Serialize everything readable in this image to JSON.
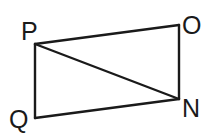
{
  "diagram": {
    "type": "quadrilateral-with-diagonal",
    "stroke_color": "#1a1a1a",
    "vertices": {
      "P": {
        "label": "P",
        "x": 35,
        "y": 44
      },
      "O": {
        "label": "O",
        "x": 179,
        "y": 25
      },
      "N": {
        "label": "N",
        "x": 179,
        "y": 99
      },
      "Q": {
        "label": "Q",
        "x": 35,
        "y": 118
      }
    },
    "edges": [
      [
        "P",
        "O"
      ],
      [
        "O",
        "N"
      ],
      [
        "N",
        "Q"
      ],
      [
        "Q",
        "P"
      ],
      [
        "P",
        "N"
      ]
    ]
  }
}
